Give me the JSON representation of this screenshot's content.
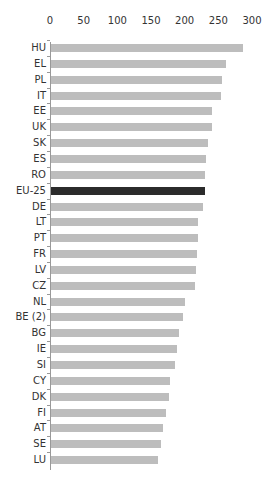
{
  "chart_data": {
    "type": "bar",
    "orientation": "horizontal",
    "title": "",
    "xlabel": "",
    "ylabel": "",
    "xlim": [
      0,
      300
    ],
    "x_ticks": [
      0,
      50,
      100,
      150,
      200,
      250,
      300
    ],
    "grid": false,
    "legend": null,
    "highlight": "EU-25",
    "colors": {
      "default": "#bdbdbd",
      "highlight": "#2b2b2b"
    },
    "categories": [
      "HU",
      "EL",
      "PL",
      "IT",
      "EE",
      "UK",
      "SK",
      "ES",
      "RO",
      "EU-25",
      "DE",
      "LT",
      "PT",
      "FR",
      "LV",
      "CZ",
      "NL",
      "BE (2)",
      "BG",
      "IE",
      "SI",
      "CY",
      "DK",
      "FI",
      "AT",
      "SE",
      "LU"
    ],
    "values": [
      285,
      260,
      254,
      253,
      239,
      239,
      233,
      230,
      229,
      229,
      226,
      218,
      218,
      217,
      215,
      214,
      199,
      196,
      190,
      187,
      184,
      177,
      175,
      171,
      166,
      163,
      159
    ]
  }
}
